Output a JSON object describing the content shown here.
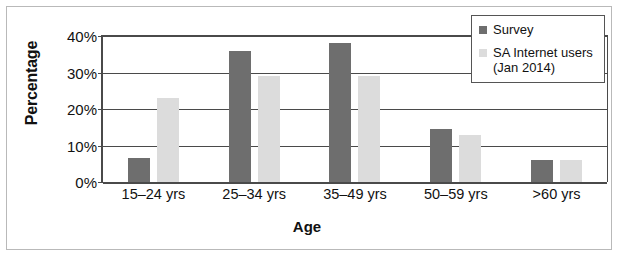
{
  "chart_data": {
    "type": "bar",
    "title": "",
    "xlabel": "Age",
    "ylabel": "Percentage",
    "categories": [
      "15–24 yrs",
      "25–34 yrs",
      "35–49 yrs",
      "50–59 yrs",
      ">60 yrs"
    ],
    "series": [
      {
        "name": "Survey",
        "color": "#6e6e6e",
        "values": [
          6.5,
          36,
          38,
          14.5,
          6
        ]
      },
      {
        "name": "SA Internet users (Jan 2014)",
        "color": "#dcdcdc",
        "values": [
          23,
          29,
          29,
          13,
          6
        ]
      }
    ],
    "ylim": [
      0,
      40
    ],
    "ytick_values": [
      0,
      10,
      20,
      30,
      40
    ],
    "ytick_labels": [
      "0%",
      "10%",
      "20%",
      "30%",
      "40%"
    ],
    "grid": true,
    "grid_axis": "y",
    "legend_position": "top-right",
    "legend_entries": [
      {
        "label": "Survey",
        "label_line2": ""
      },
      {
        "label": "SA Internet users",
        "label_line2": "(Jan 2014)"
      }
    ]
  }
}
